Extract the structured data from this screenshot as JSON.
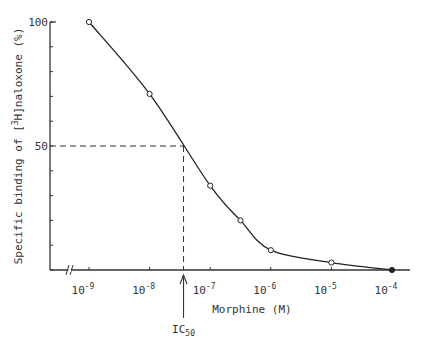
{
  "chart_data": {
    "type": "line",
    "title": "",
    "xlabel": "Morphine (M)",
    "ylabel": "Specific binding of [3H]naloxone (%)",
    "ylabel_parts": {
      "prefix": "Specific binding of [",
      "sup": "3",
      "suffix": "H]naloxone (%)"
    },
    "xscale": "log",
    "xlim_log10": [
      -9.5,
      -3.9
    ],
    "ylim": [
      0,
      100
    ],
    "y_ticks": [
      0,
      10,
      20,
      30,
      40,
      50,
      60,
      70,
      80,
      90,
      100
    ],
    "y_tick_labels": [
      {
        "value": 100,
        "label": "100"
      },
      {
        "value": 50,
        "label": "50"
      }
    ],
    "x_ticks_log10": [
      -9,
      -8,
      -7,
      -6,
      -5,
      -4
    ],
    "x_tick_labels": [
      {
        "base": "10",
        "exp": "-9"
      },
      {
        "base": "10",
        "exp": "-8"
      },
      {
        "base": "10",
        "exp": "-7"
      },
      {
        "base": "10",
        "exp": "-6"
      },
      {
        "base": "10",
        "exp": "-5"
      },
      {
        "base": "10",
        "exp": "-4"
      }
    ],
    "axis_break": true,
    "grid": false,
    "series": [
      {
        "name": "Specific binding",
        "points": [
          {
            "log10x": -9.0,
            "y": 100,
            "marker": "open"
          },
          {
            "log10x": -8.0,
            "y": 71,
            "marker": "open"
          },
          {
            "log10x": -7.0,
            "y": 34,
            "marker": "open"
          },
          {
            "log10x": -6.5,
            "y": 20,
            "marker": "open"
          },
          {
            "log10x": -6.0,
            "y": 8,
            "marker": "open"
          },
          {
            "log10x": -5.0,
            "y": 3,
            "marker": "open"
          },
          {
            "log10x": -4.0,
            "y": 0,
            "marker": "filled"
          }
        ]
      }
    ],
    "reference": {
      "y": 50,
      "log10x": -7.44
    },
    "annotations": [
      {
        "text_base": "IC",
        "text_sub": "50",
        "log10x": -7.44,
        "type": "arrow-up"
      }
    ]
  }
}
